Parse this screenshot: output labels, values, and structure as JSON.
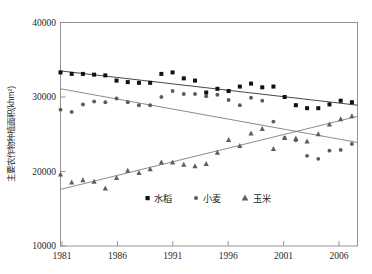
{
  "chart_data": {
    "type": "scatter",
    "title": "",
    "xlabel": "",
    "ylabel": "主要农作物种植面积(khm²)",
    "xlim": [
      1981,
      2007.5
    ],
    "ylim": [
      10000,
      40000
    ],
    "grid": false,
    "legend_position": "bottom-center",
    "xticks": [
      "1981",
      "1986",
      "1991",
      "1996",
      "2001",
      "2006"
    ],
    "xtick_values": [
      1981,
      1986,
      1991,
      1996,
      2001,
      2006
    ],
    "yticks": [
      "10000",
      "20000",
      "30000",
      "40000"
    ],
    "ytick_values": [
      10000,
      20000,
      30000,
      40000
    ],
    "x": [
      1981,
      1982,
      1983,
      1984,
      1985,
      1986,
      1987,
      1988,
      1989,
      1990,
      1991,
      1992,
      1993,
      1994,
      1995,
      1996,
      1997,
      1998,
      1999,
      2000,
      2001,
      2002,
      2003,
      2004,
      2005,
      2006,
      2007
    ],
    "series": [
      {
        "name": "水稻",
        "marker": "square",
        "color": "#111111",
        "values": [
          33300,
          33100,
          33100,
          33000,
          32900,
          32200,
          32000,
          31900,
          31900,
          33100,
          33300,
          32500,
          32200,
          30600,
          31100,
          30800,
          31400,
          31800,
          31300,
          31400,
          30000,
          28900,
          28500,
          28500,
          29000,
          29500,
          29300
        ]
      },
      {
        "name": "小麦",
        "marker": "circle",
        "color": "#5b5b5b",
        "values": [
          28300,
          28000,
          29000,
          29400,
          29300,
          29800,
          29300,
          28900,
          28900,
          30000,
          30800,
          30400,
          30400,
          30100,
          30300,
          29600,
          28900,
          29900,
          29500,
          26700,
          24500,
          24200,
          22100,
          21700,
          22800,
          22900,
          23700
        ]
      },
      {
        "name": "玉米",
        "marker": "triangle",
        "color": "#5e5e5e",
        "values": [
          19600,
          18500,
          18800,
          18600,
          17700,
          19100,
          20100,
          19800,
          20300,
          21200,
          21200,
          20900,
          20700,
          21000,
          22500,
          24200,
          23400,
          25100,
          25700,
          23000,
          24500,
          24400,
          24000,
          25000,
          26300,
          27000,
          27400
        ]
      }
    ],
    "trendlines": [
      {
        "name": "水稻",
        "x0": 1981,
        "y0": 33500,
        "x1": 2007.5,
        "y1": 28900
      },
      {
        "name": "小麦",
        "x0": 1981,
        "y0": 31100,
        "x1": 2007.5,
        "y1": 23900
      },
      {
        "name": "玉米",
        "x0": 1981,
        "y0": 17600,
        "x1": 2007.5,
        "y1": 27400
      }
    ]
  },
  "legend": {
    "items": [
      {
        "label": "水稻",
        "marker": "square"
      },
      {
        "label": "小麦",
        "marker": "circle"
      },
      {
        "label": "玉米",
        "marker": "triangle"
      }
    ]
  },
  "axes": {
    "y_axis_title": "主要农作物种植面积(khm²)"
  }
}
